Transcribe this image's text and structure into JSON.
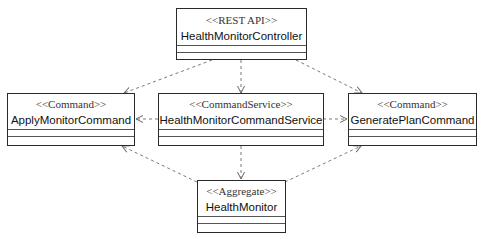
{
  "diagram": {
    "type": "uml-class-diagram",
    "line_color": "#7a7a7a",
    "box_border_color": "#2a2a2a",
    "classes": [
      {
        "id": "controller",
        "stereotype": "<<REST API>>",
        "name": "HealthMonitorController"
      },
      {
        "id": "apply",
        "stereotype": "<<Command>>",
        "name": "ApplyMonitorCommand"
      },
      {
        "id": "service",
        "stereotype": "<<CommandService>>",
        "name": "HealthMonitorCommandService"
      },
      {
        "id": "generate",
        "stereotype": "<<Command>>",
        "name": "GeneratePlanCommand"
      },
      {
        "id": "aggregate",
        "stereotype": "<<Aggregate>>",
        "name": "HealthMonitor"
      }
    ],
    "dependencies": [
      {
        "from": "controller",
        "to": "apply",
        "style": "dashed-open-arrow"
      },
      {
        "from": "controller",
        "to": "service",
        "style": "dashed-open-arrow"
      },
      {
        "from": "controller",
        "to": "generate",
        "style": "dashed-open-arrow"
      },
      {
        "from": "service",
        "to": "apply",
        "style": "dashed-open-arrow"
      },
      {
        "from": "service",
        "to": "generate",
        "style": "dashed-open-arrow"
      },
      {
        "from": "service",
        "to": "aggregate",
        "style": "dashed-open-arrow"
      },
      {
        "from": "aggregate",
        "to": "apply",
        "style": "dashed-open-arrow"
      },
      {
        "from": "aggregate",
        "to": "generate",
        "style": "dashed-open-arrow"
      }
    ]
  }
}
